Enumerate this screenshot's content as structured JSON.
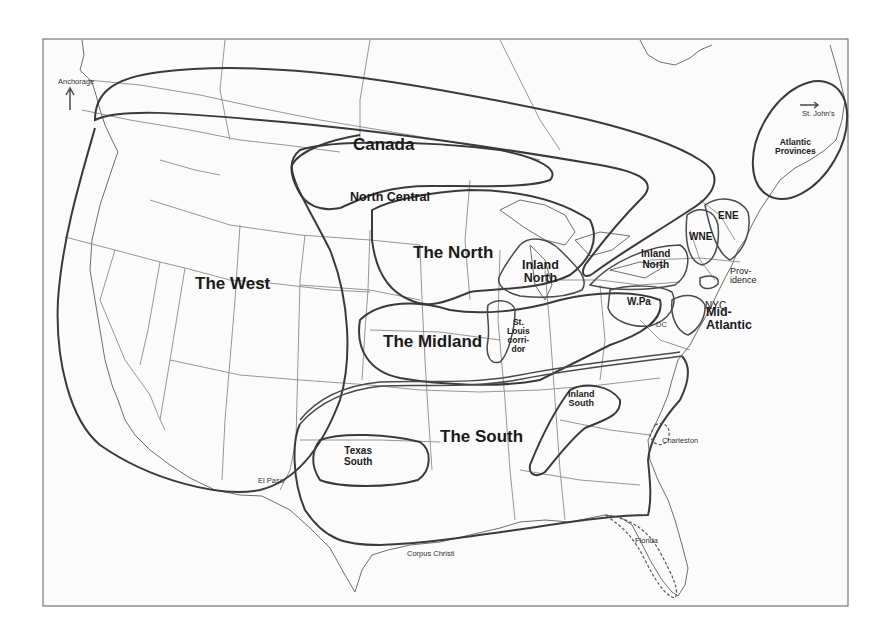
{
  "map": {
    "title": "",
    "type": "dialect regions map of North America",
    "colors": {
      "background": "#ffffff",
      "land": "#fbfbfb",
      "region_outline": "#3a3a3a",
      "state_line": "#8a8a8a"
    },
    "regions": {
      "canada": "Canada",
      "north_central": "North Central",
      "the_west": "The West",
      "the_north": "The North",
      "inland_north_west": [
        "Inland",
        "North"
      ],
      "inland_north_east": [
        "Inland",
        "North"
      ],
      "the_midland": "The Midland",
      "st_louis_corridor": [
        "St.",
        "Louis",
        "corri-",
        "dor"
      ],
      "the_south": "The South",
      "texas_south": [
        "Texas",
        "South"
      ],
      "inland_south": [
        "Inland",
        "South"
      ],
      "w_pa": "W.Pa",
      "wne": "WNE",
      "ene": "ENE",
      "mid_atlantic": [
        "Mid-",
        "Atlantic"
      ],
      "atlantic_provinces": [
        "Atlantic",
        "Provinces"
      ],
      "providence": [
        "Prov-",
        "idence"
      ],
      "nyc": "NYC"
    },
    "cities": {
      "anchorage": "Anchorage",
      "st_johns": "St. John's",
      "dc": "DC",
      "charleston": "Charleston",
      "el_paso": "El Paso",
      "corpus_christi": "Corpus Christi",
      "florida": "Florida"
    }
  }
}
